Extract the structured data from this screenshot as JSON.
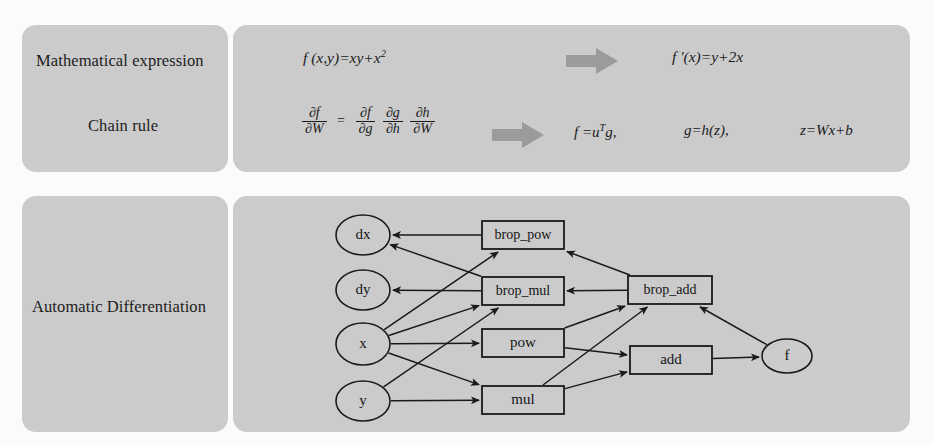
{
  "figure": {
    "panel_bg": "#cbcbcb",
    "page_bg": "#fbfbfa",
    "arrow_color": "#9a9a9a",
    "stroke_color": "#1a1a1a"
  },
  "rows": {
    "math_label": "Mathematical expression",
    "chain_label": "Chain rule",
    "autodiff_label": "Automatic Differentiation"
  },
  "formulas": {
    "expression": "f (x,y)=xy+x",
    "expression_sup": "2",
    "derivative": "f '(x)=y+2x",
    "chain": {
      "lhs_num": "∂f",
      "lhs_den": "∂W",
      "eq": "=",
      "t1_num": "∂f",
      "t1_den": "∂g",
      "t2_num": "∂g",
      "t2_den": "∂h",
      "t3_num": "∂h",
      "t3_den": "∂W"
    },
    "decomposition": {
      "f": "f =u",
      "f_sup": "T",
      "f_tail": "g,",
      "g": "g=h(z),",
      "z": "z=Wx+b"
    }
  },
  "arrows": {
    "top_arrow_name": "block-arrow-right",
    "chain_arrow_name": "block-arrow-right"
  },
  "chart_data": {
    "type": "diagram",
    "nodes": [
      {
        "id": "dx",
        "label": "dx",
        "shape": "ellipse",
        "cx": 130,
        "cy": 39,
        "rx": 27,
        "ry": 20
      },
      {
        "id": "dy",
        "label": "dy",
        "shape": "ellipse",
        "cx": 130,
        "cy": 94,
        "rx": 27,
        "ry": 20
      },
      {
        "id": "x",
        "label": "x",
        "shape": "ellipse",
        "cx": 130,
        "cy": 148,
        "rx": 27,
        "ry": 21
      },
      {
        "id": "y",
        "label": "y",
        "shape": "ellipse",
        "cx": 130,
        "cy": 205,
        "rx": 27,
        "ry": 20
      },
      {
        "id": "brop_pow",
        "label": "brop_pow",
        "shape": "rect",
        "x": 249,
        "y": 25,
        "w": 82,
        "h": 28
      },
      {
        "id": "brop_mul",
        "label": "brop_mul",
        "shape": "rect",
        "x": 249,
        "y": 81,
        "w": 82,
        "h": 28
      },
      {
        "id": "pow",
        "label": "pow",
        "shape": "rect",
        "x": 249,
        "y": 133,
        "w": 82,
        "h": 28
      },
      {
        "id": "mul",
        "label": "mul",
        "shape": "rect",
        "x": 249,
        "y": 190,
        "w": 82,
        "h": 28
      },
      {
        "id": "brop_add",
        "label": "brop_add",
        "shape": "rect",
        "x": 395,
        "y": 80,
        "w": 84,
        "h": 28
      },
      {
        "id": "add",
        "label": "add",
        "shape": "rect",
        "x": 397,
        "y": 150,
        "w": 82,
        "h": 28
      },
      {
        "id": "f",
        "label": "f",
        "shape": "ellipse",
        "cx": 554,
        "cy": 160,
        "rx": 25,
        "ry": 17
      }
    ],
    "edges": [
      {
        "from": "brop_pow",
        "to": "dx"
      },
      {
        "from": "brop_mul",
        "to": "dx"
      },
      {
        "from": "brop_mul",
        "to": "dy"
      },
      {
        "from": "x",
        "to": "brop_pow"
      },
      {
        "from": "x",
        "to": "brop_mul"
      },
      {
        "from": "x",
        "to": "pow"
      },
      {
        "from": "x",
        "to": "mul"
      },
      {
        "from": "y",
        "to": "brop_mul"
      },
      {
        "from": "y",
        "to": "mul"
      },
      {
        "from": "brop_add",
        "to": "brop_pow"
      },
      {
        "from": "brop_add",
        "to": "brop_mul"
      },
      {
        "from": "pow",
        "to": "brop_add"
      },
      {
        "from": "pow",
        "to": "add"
      },
      {
        "from": "mul",
        "to": "brop_add"
      },
      {
        "from": "mul",
        "to": "add"
      },
      {
        "from": "add",
        "to": "f"
      },
      {
        "from": "f",
        "to": "brop_add"
      }
    ]
  }
}
